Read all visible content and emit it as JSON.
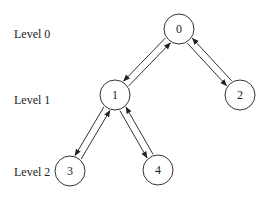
{
  "levels": [
    {
      "label": "Level 0",
      "x": 14,
      "y": 38
    },
    {
      "label": "Level 1",
      "x": 14,
      "y": 104
    },
    {
      "label": "Level 2",
      "x": 14,
      "y": 176
    }
  ],
  "nodes": [
    {
      "id": "0",
      "label": "0",
      "x": 179,
      "y": 29
    },
    {
      "id": "1",
      "label": "1",
      "x": 115,
      "y": 95
    },
    {
      "id": "2",
      "label": "2",
      "x": 240,
      "y": 95
    },
    {
      "id": "3",
      "label": "3",
      "x": 70,
      "y": 171
    },
    {
      "id": "4",
      "label": "4",
      "x": 158,
      "y": 170
    }
  ],
  "edges": [
    {
      "from": "0",
      "to": "1",
      "direction": "down"
    },
    {
      "from": "1",
      "to": "0",
      "direction": "up"
    },
    {
      "from": "0",
      "to": "2",
      "direction": "down"
    },
    {
      "from": "2",
      "to": "0",
      "direction": "up"
    },
    {
      "from": "1",
      "to": "3",
      "direction": "down"
    },
    {
      "from": "3",
      "to": "1",
      "direction": "up"
    },
    {
      "from": "1",
      "to": "4",
      "direction": "down"
    },
    {
      "from": "4",
      "to": "1",
      "direction": "up"
    }
  ],
  "style": {
    "stroke": "#333333",
    "background": "#ffffff",
    "node_radius": 15
  }
}
